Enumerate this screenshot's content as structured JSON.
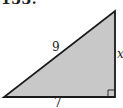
{
  "problem": {
    "number": "133."
  },
  "triangle": {
    "type": "right-triangle",
    "fill_color": "#c8c8c8",
    "stroke_color": "#1a1a1a",
    "vertices": {
      "bottom_left": [
        4,
        97
      ],
      "bottom_right": [
        115,
        97
      ],
      "top_right": [
        115,
        11
      ]
    },
    "right_angle_at": "bottom_right",
    "labels": {
      "hypotenuse": "9",
      "base": "7",
      "vertical_side": "x"
    }
  }
}
